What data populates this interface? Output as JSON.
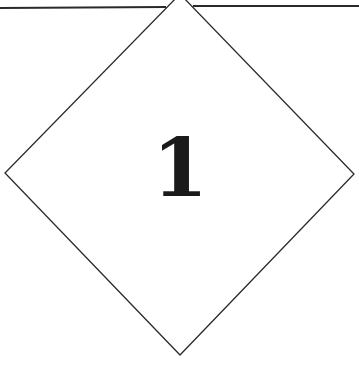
{
  "figure": {
    "label": "1",
    "shape": "diamond",
    "line_color": "#2a2a2a",
    "background": "#ffffff"
  }
}
